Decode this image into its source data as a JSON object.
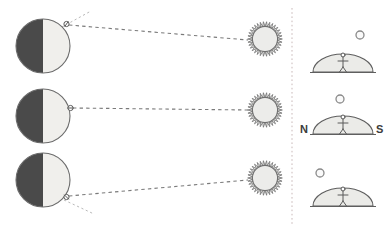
{
  "figure": {
    "width": 391,
    "height": 236,
    "background": "#ffffff"
  },
  "colors": {
    "earth_night": "#4a4a4a",
    "earth_day": "#f0efec",
    "earth_outline": "#6b6b6b",
    "sun_fill": "#ececea",
    "sun_outline": "#6f6f6f",
    "dome_fill": "#ebebe8",
    "dome_outline": "#5f5f5f",
    "sight_line": "#7a7a7a",
    "tangent_line": "#b9b9b9",
    "divider": "#c9b9b9",
    "figure_stroke": "#5a5a5a",
    "label_text": "#3c3c3c"
  },
  "left_panel": {
    "name": "earth-sun-geometry-panel",
    "rows": [
      {
        "id": "row-top",
        "label": "observer-at-northern-latitude",
        "earth": {
          "cx": 43,
          "cy": 46,
          "r": 27,
          "night_side": "left",
          "day_side": "right"
        },
        "observer": {
          "cx": 66.5,
          "cy": 24,
          "latitude_deg": 55,
          "marker": "small-circle-with-tick"
        },
        "sun": {
          "cx": 265,
          "cy": 39,
          "r": 17,
          "ray_count": 34
        },
        "sight_line": {
          "from_x": 69,
          "from_y": 25,
          "to_x": 248,
          "to_y": 40,
          "style": "dashed"
        },
        "tangent_line": {
          "from_x": 62,
          "from_y": 27,
          "to_x": 91,
          "to_y": 11,
          "style": "dotted"
        }
      },
      {
        "id": "row-middle",
        "label": "observer-at-equator",
        "earth": {
          "cx": 43,
          "cy": 116,
          "r": 27,
          "night_side": "left",
          "day_side": "right"
        },
        "observer": {
          "cx": 70.5,
          "cy": 108,
          "latitude_deg": 0,
          "marker": "small-circle-with-tick"
        },
        "sun": {
          "cx": 265,
          "cy": 110,
          "r": 17,
          "ray_count": 34
        },
        "sight_line": {
          "from_x": 73,
          "from_y": 108,
          "to_x": 248,
          "to_y": 110,
          "style": "dashed"
        },
        "tangent_line": null
      },
      {
        "id": "row-bottom",
        "label": "observer-at-southern-latitude",
        "earth": {
          "cx": 43,
          "cy": 180,
          "r": 27,
          "night_side": "left",
          "day_side": "right"
        },
        "observer": {
          "cx": 66.5,
          "cy": 197,
          "latitude_deg": -45,
          "marker": "small-circle-with-tick"
        },
        "sun": {
          "cx": 265,
          "cy": 178,
          "r": 17,
          "ray_count": 34
        },
        "sight_line": {
          "from_x": 69,
          "from_y": 196,
          "to_x": 248,
          "to_y": 180,
          "style": "dashed"
        },
        "tangent_line": {
          "from_x": 64,
          "from_y": 200,
          "to_x": 94,
          "to_y": 214,
          "style": "dotted"
        }
      }
    ]
  },
  "divider": {
    "name": "panel-divider",
    "x": 292,
    "y_start": 8,
    "y_end": 226,
    "style": "dotted"
  },
  "right_panel": {
    "name": "local-sky-view-panel",
    "views": [
      {
        "id": "sky-view-top",
        "label": "sun-low-in-north-sky",
        "dome": {
          "cx": 343,
          "cy": 72,
          "rx": 30,
          "ry": 18
        },
        "observer": {
          "x": 343,
          "y": 55
        },
        "sun": {
          "cx": 360,
          "cy": 35,
          "r": 4
        },
        "cardinals": null
      },
      {
        "id": "sky-view-middle",
        "label": "sun-overhead-at-zenith",
        "dome": {
          "cx": 343,
          "cy": 134,
          "rx": 30,
          "ry": 18
        },
        "observer": {
          "x": 343,
          "y": 117
        },
        "sun": {
          "cx": 340,
          "cy": 99,
          "r": 4
        },
        "cardinals": {
          "left": "N",
          "right": "S"
        }
      },
      {
        "id": "sky-view-bottom",
        "label": "sun-low-in-south-sky",
        "dome": {
          "cx": 343,
          "cy": 206,
          "rx": 30,
          "ry": 18
        },
        "observer": {
          "x": 343,
          "y": 189
        },
        "sun": {
          "cx": 320,
          "cy": 173,
          "r": 4
        },
        "cardinals": null
      }
    ]
  },
  "labels": {
    "north": "N",
    "south": "S"
  }
}
